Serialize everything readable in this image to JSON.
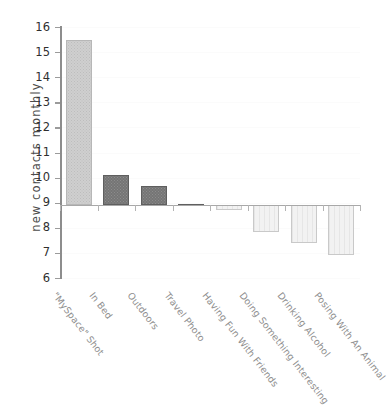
{
  "chart_data": {
    "type": "bar",
    "title": "",
    "xlabel": "",
    "ylabel": "new contacts monthly",
    "categories": [
      "\"MySpace\" Shot",
      "In Bed",
      "Outdoors",
      "Travel Photo",
      "Having Fun With Friends",
      "Doing Something Interesting",
      "Drinking Alcohol",
      "Posing With An Animal"
    ],
    "values": [
      15.5,
      10.1,
      9.65,
      8.95,
      8.7,
      7.85,
      7.4,
      6.9
    ],
    "baseline": 8.9,
    "ylim": [
      6,
      16
    ],
    "yticks": [
      6,
      7,
      8,
      9,
      10,
      11,
      12,
      13,
      14,
      15,
      16
    ],
    "ytick_labels": [
      "6",
      "7",
      "8",
      "9",
      "10",
      "11",
      "12",
      "13",
      "14",
      "15",
      "16"
    ],
    "grid": true,
    "legend": "none",
    "bar_styles": [
      "light",
      "dark",
      "dark",
      "dark",
      "pale",
      "pale",
      "pale",
      "pale"
    ],
    "colors": {
      "bar_light": "#cfcfcf",
      "bar_dark": "#757575",
      "bar_pale": "#f2f2f2",
      "axis": "#8d8d8d",
      "tick_text": "#2f2f2f",
      "category_text": "#8e8e8e",
      "axis_title": "#4c4c4c",
      "background": "#ffffff"
    }
  }
}
